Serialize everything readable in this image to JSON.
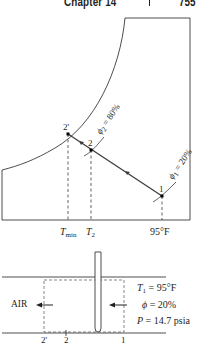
{
  "header": {
    "chapter": "Chapter 14",
    "page": "755"
  },
  "chart": {
    "point_labels": [
      "2'",
      "2",
      "1"
    ],
    "phi2_label": "ϕ",
    "phi2_sub": "2",
    "phi2_rest": " = 80%",
    "phi1_label": "ϕ",
    "phi1_sub": "1",
    "phi1_rest": " = 20%",
    "axis_labels": {
      "tmin": "T",
      "tmin_sub": "min",
      "t2": "T",
      "t2_sub": "2",
      "t1": "95°F"
    }
  },
  "device": {
    "air_label": "AIR",
    "t1_label": "T",
    "t1_sub": "1",
    "t1_value": " = 95°F",
    "phi_label": "ϕ",
    "phi_value": " = 20%",
    "p_label": "P",
    "p_value": " = 14.7 psia",
    "station_labels": [
      "2'",
      "2",
      "1"
    ]
  },
  "colors": {
    "line": "#231f20",
    "process_line": "#3a3a3a"
  }
}
